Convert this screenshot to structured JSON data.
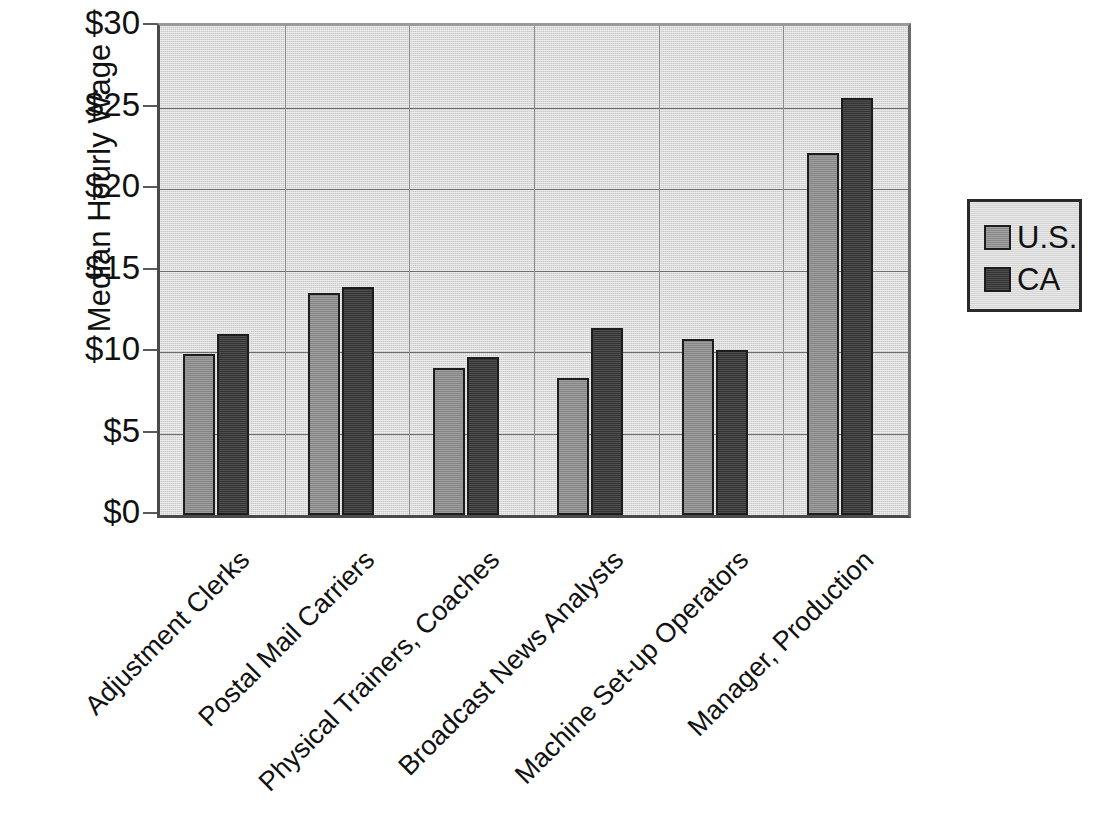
{
  "chart_data": {
    "type": "bar",
    "title": "",
    "subtitle": "",
    "xlabel": "",
    "ylabel": "Median Hourly Wage",
    "ylim": [
      0,
      30
    ],
    "ytick_values": [
      0,
      5,
      10,
      15,
      20,
      25,
      30
    ],
    "ytick_labels": [
      "$0",
      "$5",
      "$10",
      "$15",
      "$20",
      "$25",
      "$30"
    ],
    "xtick_label_rotation": -45,
    "grid": "horizontal",
    "legend_position": "right-outside",
    "categories": [
      "Adjustment Clerks",
      "Postal Mail Carriers",
      "Physical Trainers, Coaches",
      "Broadcast News Analysts",
      "Machine Set-up Operators",
      "Manager, Production"
    ],
    "series": [
      {
        "name": "U.S.",
        "color": "#8e8e8e",
        "values": [
          9.9,
          13.6,
          9.0,
          8.4,
          10.8,
          22.2
        ]
      },
      {
        "name": "CA",
        "color": "#3a3a3a",
        "values": [
          11.1,
          14.0,
          9.7,
          11.5,
          10.1,
          25.6
        ]
      }
    ],
    "annotations": []
  },
  "legend": {
    "entries": [
      {
        "label": "U.S.",
        "swatch": "us"
      },
      {
        "label": "CA",
        "swatch": "ca"
      }
    ]
  },
  "colors": {
    "plot_background": "#c9c9c9",
    "axis": "#4a4a4a",
    "gridline": "#6e6e6e",
    "series_us": "#8e8e8e",
    "series_ca": "#3a3a3a",
    "bar_outline": "#1d1d1d",
    "page_background": "#ffffff"
  }
}
